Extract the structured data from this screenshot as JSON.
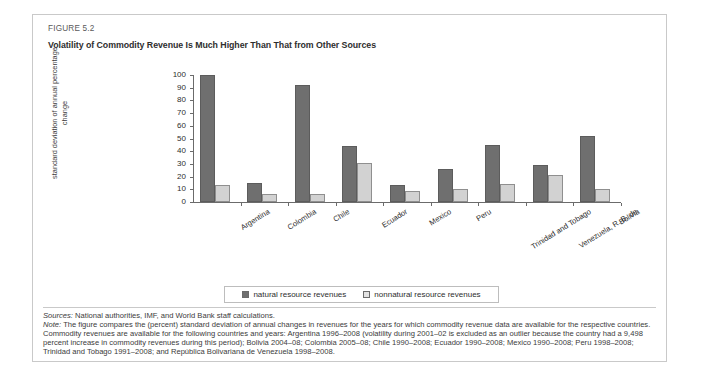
{
  "figure": {
    "number": "FIGURE 5.2",
    "title": "Volatility of Commodity Revenue Is Much Higher Than That from Other Sources"
  },
  "legend": {
    "natural_label": "natural resource revenues",
    "nonnatural_label": "nonnatural resource revenues"
  },
  "footnotes": {
    "sources_lead": "Sources:",
    "sources_text": " National authorities, IMF, and World Bank staff calculations.",
    "note_lead": "Note:",
    "note_text": " The figure compares the (percent) standard deviation of annual changes in revenues for the years for which commodity revenue data are available for the respective countries. Commodity revenues are available for the following countries and years: Argentina 1996–2008 (volatility during 2001–02 is excluded as an outlier because the country had a 9,498 percent increase in commodity revenues during this period); Bolivia 2004–08; Colombia 2005–08; Chile 1990–2008; Ecuador 1990–2008; Mexico 1990–2008; Peru 1998–2008; Trinidad and Tobago 1991–2008; and República Bolivariana de Venezuela 1998–2008."
  },
  "colors": {
    "natural": "#6f6f6f",
    "nonnatural": "#d2d2d2",
    "axis": "#6b6b6b",
    "frame": "#c9c9c9"
  },
  "chart_data": {
    "type": "bar",
    "title": "Volatility of Commodity Revenue Is Much Higher Than That from Other Sources",
    "xlabel": "",
    "ylabel": "standard deviation of annual percentage change",
    "ylim": [
      0,
      100
    ],
    "yticks": [
      0,
      10,
      20,
      30,
      40,
      50,
      60,
      70,
      80,
      90,
      100
    ],
    "grid": false,
    "legend_position": "bottom",
    "categories": [
      "Argentina",
      "Colombia",
      "Chile",
      "Ecuador",
      "Mexico",
      "Peru",
      "Trinidad and Tobago",
      "Venezuela, R. B. de",
      "Bolivia"
    ],
    "series": [
      {
        "name": "natural resource revenues",
        "color": "#6f6f6f",
        "values": [
          100,
          15,
          92,
          44,
          13,
          26,
          45,
          29,
          52
        ]
      },
      {
        "name": "nonnatural resource revenues",
        "color": "#d2d2d2",
        "values": [
          13,
          6,
          6,
          31,
          9,
          10,
          14,
          21,
          10
        ]
      }
    ]
  }
}
